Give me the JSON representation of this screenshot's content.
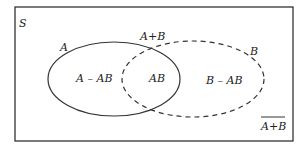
{
  "diagram": {
    "type": "venn",
    "universe_label": "S",
    "set_a": {
      "label": "A",
      "style": "solid"
    },
    "set_b": {
      "label": "B",
      "style": "dashed"
    },
    "union_label": "A+B",
    "regions": {
      "a_only": "A – AB",
      "intersection": "AB",
      "b_only": "B – AB"
    },
    "complement_label": "A+B",
    "complement_overlined": true,
    "colors": {
      "stroke": "#333333",
      "background": "#ffffff"
    }
  }
}
